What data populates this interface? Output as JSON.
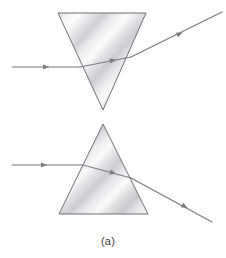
{
  "figure": {
    "caption": "(a)",
    "background_color": "#ffffff",
    "outline_color": "#6e6e76",
    "ray_color": "#7b7b85",
    "glass_light": "#fdfdfd",
    "glass_mid": "#e9e9ec",
    "glass_dark": "#c9c9cf",
    "stroke_width": 1,
    "ray_width": 1.2
  },
  "prisms": [
    {
      "id": "upper-prism",
      "name": "inverted-prism",
      "orientation": "apex-down",
      "vertices": [
        {
          "x": 58,
          "y": 13
        },
        {
          "x": 146,
          "y": 13
        },
        {
          "x": 103,
          "y": 110
        }
      ]
    },
    {
      "id": "lower-prism",
      "name": "upright-prism",
      "orientation": "apex-up",
      "vertices": [
        {
          "x": 103,
          "y": 124
        },
        {
          "x": 148,
          "y": 214
        },
        {
          "x": 59,
          "y": 214
        }
      ]
    }
  ],
  "rays": [
    {
      "id": "upper-incident-ray",
      "label": "incident ray upper",
      "points": [
        {
          "x": 12,
          "y": 67
        },
        {
          "x": 80,
          "y": 67
        }
      ],
      "arrow_at": {
        "x": 43,
        "y": 67,
        "angle": 0
      }
    },
    {
      "id": "upper-internal-ray",
      "label": "refracted ray inside upper prism",
      "points": [
        {
          "x": 80,
          "y": 67
        },
        {
          "x": 131,
          "y": 57
        }
      ],
      "arrow_at": {
        "x": 110,
        "y": 61,
        "angle": -11
      }
    },
    {
      "id": "upper-exit-ray",
      "label": "emergent ray upper",
      "points": [
        {
          "x": 131,
          "y": 57
        },
        {
          "x": 222,
          "y": 12
        }
      ],
      "arrow_at": {
        "x": 177,
        "y": 35,
        "angle": -26
      }
    },
    {
      "id": "lower-incident-ray",
      "label": "incident ray lower",
      "points": [
        {
          "x": 12,
          "y": 165
        },
        {
          "x": 83,
          "y": 165
        }
      ],
      "arrow_at": {
        "x": 41,
        "y": 165,
        "angle": 0
      }
    },
    {
      "id": "lower-internal-ray",
      "label": "refracted ray inside lower prism",
      "points": [
        {
          "x": 83,
          "y": 165
        },
        {
          "x": 131,
          "y": 178
        }
      ],
      "arrow_at": {
        "x": 110,
        "y": 172,
        "angle": 15
      }
    },
    {
      "id": "lower-exit-ray",
      "label": "emergent ray lower",
      "points": [
        {
          "x": 131,
          "y": 178
        },
        {
          "x": 212,
          "y": 222
        }
      ],
      "arrow_at": {
        "x": 182,
        "y": 205,
        "angle": 28
      }
    }
  ],
  "caption_position": {
    "x": 108,
    "y": 245
  }
}
